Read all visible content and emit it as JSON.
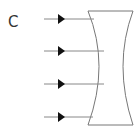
{
  "diagram": {
    "label": "C",
    "type": "concave (diverging) lens with parallel incident rays",
    "ray_count": 4,
    "colors": {
      "ray_line": "#888888",
      "arrowhead": "#111111",
      "lens_outline": "#777777",
      "lens_fill": "#ffffff",
      "label": "#333333"
    }
  }
}
